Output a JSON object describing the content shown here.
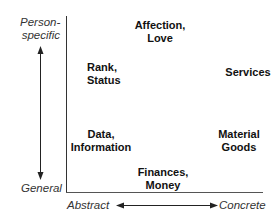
{
  "diagram": {
    "y_axis": {
      "top_label_line1": "Person-",
      "top_label_line2": "specific",
      "bottom_label": "General"
    },
    "x_axis": {
      "left_label": "Abstract",
      "right_label": "Concrete"
    },
    "resources": [
      {
        "line1": "Affection,",
        "line2": "Love"
      },
      {
        "line1": "Rank,",
        "line2": "Status"
      },
      {
        "line1": "Services",
        "line2": ""
      },
      {
        "line1": "Data,",
        "line2": "Information"
      },
      {
        "line1": "Material",
        "line2": "Goods"
      },
      {
        "line1": "Finances,",
        "line2": "Money"
      }
    ]
  }
}
